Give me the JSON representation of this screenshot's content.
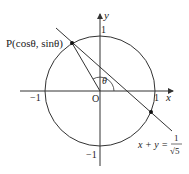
{
  "labels": {
    "point_p": "P(cosθ, sinθ)",
    "y_axis": "y",
    "x_axis": "x",
    "y_one": "1",
    "y_neg_one": "−1",
    "x_one": "1",
    "x_neg_one": "−1",
    "origin": "O",
    "theta": "θ",
    "line_eq_lhs": "x + y =",
    "line_eq_num": "1",
    "line_eq_den": "√5"
  },
  "colors": {
    "stroke": "#333333",
    "background": "#ffffff"
  }
}
